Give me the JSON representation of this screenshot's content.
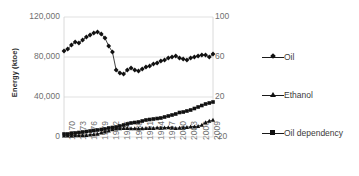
{
  "chart_data": {
    "type": "line",
    "title": "",
    "xlabel": "",
    "ylabel": "Energy (ktoe)",
    "y2label": "",
    "grid": true,
    "legend_position": "right",
    "x": [
      1970,
      1971,
      1972,
      1973,
      1974,
      1975,
      1976,
      1977,
      1978,
      1979,
      1980,
      1981,
      1982,
      1983,
      1984,
      1985,
      1986,
      1987,
      1988,
      1989,
      1990,
      1991,
      1992,
      1993,
      1994,
      1995,
      1996,
      1997,
      1998,
      1999,
      2000,
      2001,
      2002,
      2003,
      2004,
      2005,
      2006,
      2007,
      2008,
      2009,
      2010
    ],
    "xtick_labels": [
      "1970",
      "1973",
      "1976",
      "1979",
      "1982",
      "1985",
      "1988",
      "1991",
      "1994",
      "1997",
      "2000",
      "2003",
      "2006",
      "2009"
    ],
    "ytick_labels": [
      "0",
      "40,000",
      "80,000",
      "120,000"
    ],
    "ylim": [
      0,
      120000
    ],
    "y2tick_labels": [
      "-20",
      "20",
      "60",
      "100"
    ],
    "y2lim": [
      -20,
      100
    ],
    "series": [
      {
        "name": "Oil",
        "axis": "left",
        "marker": "diamond",
        "color": "#111111",
        "values": [
          86000,
          88000,
          92000,
          95000,
          94000,
          97000,
          100000,
          102000,
          104000,
          105000,
          103000,
          99000,
          91000,
          85000,
          67000,
          64000,
          63000,
          67000,
          69000,
          67000,
          66000,
          68000,
          70000,
          71000,
          73000,
          74000,
          76000,
          77000,
          79000,
          80000,
          81000,
          79000,
          78000,
          77000,
          79000,
          80000,
          81000,
          82000,
          82000,
          80000,
          83000
        ]
      },
      {
        "name": "Ethanol",
        "axis": "left",
        "marker": "triangle",
        "color": "#111111",
        "values": [
          1200,
          1300,
          1400,
          1500,
          1600,
          1700,
          1900,
          2200,
          2600,
          3100,
          4200,
          5400,
          6200,
          7600,
          8200,
          8600,
          8800,
          8700,
          8600,
          8500,
          8300,
          8600,
          8800,
          8700,
          8900,
          9200,
          9100,
          9400,
          9600,
          9200,
          8800,
          9000,
          9400,
          9800,
          10200,
          10400,
          10800,
          12000,
          14500,
          16000,
          17000
        ]
      },
      {
        "name": "Oil dependency",
        "axis": "right",
        "marker": "square",
        "color": "#111111",
        "values": [
          -17,
          -17,
          -16.5,
          -16,
          -15.5,
          -15,
          -14.5,
          -14,
          -13.5,
          -13,
          -12.5,
          -12,
          -11,
          -10.5,
          -10,
          -9,
          -8,
          -7,
          -6,
          -5.5,
          -5,
          -4,
          -3,
          -2.5,
          -2,
          -1.5,
          -1,
          0,
          1,
          2,
          3,
          4.5,
          5,
          6,
          7,
          8.5,
          10,
          11.5,
          13,
          14,
          15
        ]
      }
    ]
  },
  "legend": {
    "items": [
      {
        "label": "Oil",
        "marker": "diamond"
      },
      {
        "label": "Ethanol",
        "marker": "triangle"
      },
      {
        "label": "Oil dependency",
        "marker": "square"
      }
    ]
  }
}
